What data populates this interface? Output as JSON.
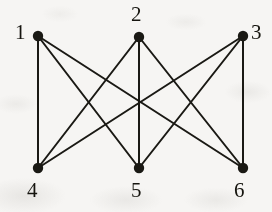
{
  "figure": {
    "kind": "graph-diagram",
    "width": 272,
    "height": 212,
    "background_color": "#f6f5f3",
    "ink_color": "#1a1914",
    "edge_width": 2.0,
    "vertex_radius": 5.2
  },
  "chart_data": {
    "type": "diagram",
    "title": "",
    "nodes": [
      {
        "id": "1",
        "label": "1",
        "x": 38,
        "y": 36,
        "row": "top",
        "label_x": 15,
        "label_y": 22,
        "label_anchor": "right-of-left"
      },
      {
        "id": "2",
        "label": "2",
        "x": 139,
        "y": 37,
        "row": "top",
        "label_x": 131,
        "label_y": 4,
        "label_anchor": "above"
      },
      {
        "id": "3",
        "label": "3",
        "x": 243,
        "y": 36,
        "row": "top",
        "label_x": 251,
        "label_y": 22,
        "label_anchor": "left-of-right"
      },
      {
        "id": "4",
        "label": "4",
        "x": 38,
        "y": 168,
        "row": "bottom",
        "label_x": 27,
        "label_y": 180,
        "label_anchor": "below"
      },
      {
        "id": "5",
        "label": "5",
        "x": 139,
        "y": 168,
        "row": "bottom",
        "label_x": 131,
        "label_y": 180,
        "label_anchor": "below"
      },
      {
        "id": "6",
        "label": "6",
        "x": 243,
        "y": 168,
        "row": "bottom",
        "label_x": 234,
        "label_y": 180,
        "label_anchor": "below"
      }
    ],
    "edges": [
      {
        "from": "1",
        "to": "4"
      },
      {
        "from": "1",
        "to": "5"
      },
      {
        "from": "1",
        "to": "6"
      },
      {
        "from": "2",
        "to": "4"
      },
      {
        "from": "2",
        "to": "5"
      },
      {
        "from": "2",
        "to": "6"
      },
      {
        "from": "3",
        "to": "4"
      },
      {
        "from": "3",
        "to": "5"
      },
      {
        "from": "3",
        "to": "6"
      }
    ],
    "node_count": 6,
    "edge_count": 9
  }
}
